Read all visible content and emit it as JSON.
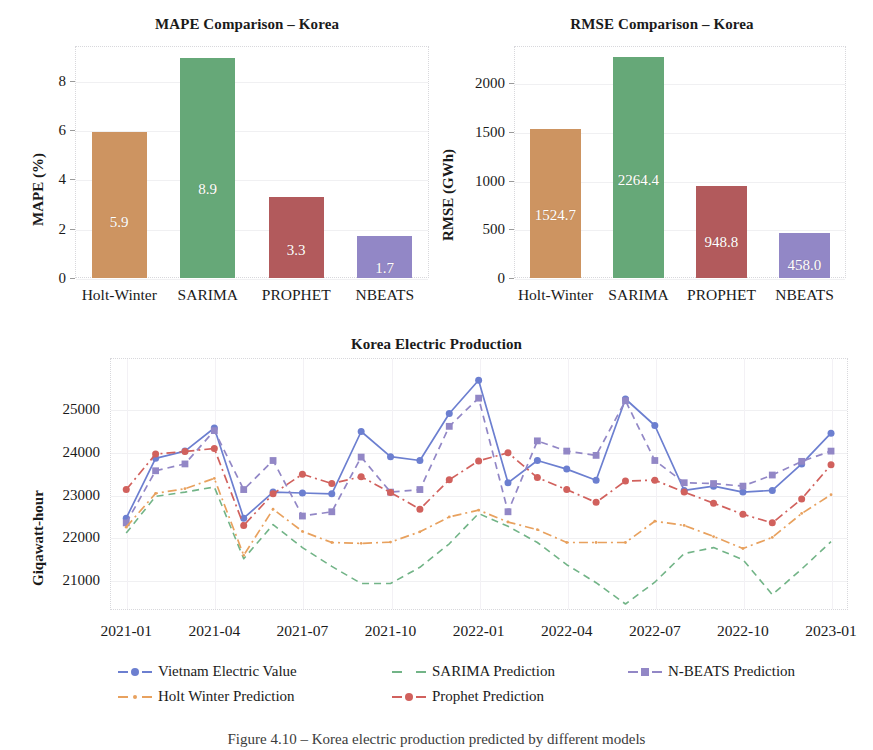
{
  "figure": {
    "caption": "Figure 4.10 – Korea electric production predicted by different models"
  },
  "chart_data": [
    {
      "id": "mape",
      "type": "bar",
      "title": "MAPE Comparison – Korea",
      "xlabel": "",
      "ylabel": "MAPE (%)",
      "categories": [
        "Holt-Winter",
        "SARIMA",
        "PROPHET",
        "NBEATS"
      ],
      "values": [
        5.9,
        8.9,
        3.3,
        1.7
      ],
      "value_labels": [
        "5.9",
        "8.9",
        "3.3",
        "1.7"
      ],
      "colors": [
        "#cd9461",
        "#66a878",
        "#b25a5c",
        "#9287c6"
      ],
      "yticks": [
        0,
        2,
        4,
        6,
        8
      ],
      "ytick_labels": [
        "0",
        "2",
        "4",
        "6",
        "8"
      ],
      "ylim": [
        0,
        9.4
      ],
      "grid": true,
      "legend": "none"
    },
    {
      "id": "rmse",
      "type": "bar",
      "title": "RMSE Comparison – Korea",
      "xlabel": "",
      "ylabel": "RMSE (GWh)",
      "categories": [
        "Holt-Winter",
        "SARIMA",
        "PROPHET",
        "NBEATS"
      ],
      "values": [
        1524.7,
        2264.4,
        948.8,
        458.0
      ],
      "value_labels": [
        "1524.7",
        "2264.4",
        "948.8",
        "458.0"
      ],
      "colors": [
        "#cd9461",
        "#66a878",
        "#b25a5c",
        "#9287c6"
      ],
      "yticks": [
        0,
        500,
        1000,
        1500,
        2000
      ],
      "ytick_labels": [
        "0",
        "500",
        "1000",
        "1500",
        "2000"
      ],
      "ylim": [
        0,
        2380
      ],
      "grid": true,
      "legend": "none"
    },
    {
      "id": "timeseries",
      "type": "line",
      "title": "Korea Electric Production",
      "xlabel": "",
      "ylabel": "Giqawatt-hour",
      "ylim": [
        20300,
        26200
      ],
      "yticks": [
        21000,
        22000,
        23000,
        24000,
        25000
      ],
      "ytick_labels": [
        "21000",
        "22000",
        "23000",
        "24000",
        "25000"
      ],
      "xtick_labels": [
        "2021-01",
        "2021-04",
        "2021-07",
        "2021-10",
        "2022-01",
        "2022-04",
        "2022-07",
        "2022-10",
        "2023-01"
      ],
      "xtick_index": [
        0,
        3,
        6,
        9,
        12,
        15,
        18,
        21,
        24
      ],
      "x": [
        "2021-01",
        "2021-02",
        "2021-03",
        "2021-04",
        "2021-05",
        "2021-06",
        "2021-07",
        "2021-08",
        "2021-09",
        "2021-10",
        "2021-11",
        "2021-12",
        "2022-01",
        "2022-02",
        "2022-03",
        "2022-04",
        "2022-05",
        "2022-06",
        "2022-07",
        "2022-08",
        "2022-09",
        "2022-10",
        "2022-11",
        "2022-12",
        "2023-01"
      ],
      "grid": true,
      "legend": "bottom",
      "series": [
        {
          "name": "Vietnam Electric Value",
          "color": "#6c7fd0",
          "marker": "circle",
          "dash": "solid",
          "values": [
            22450,
            23850,
            24020,
            24560,
            22450,
            23060,
            23040,
            23020,
            24480,
            23890,
            23800,
            24900,
            25680,
            23280,
            23800,
            23600,
            23340,
            25240,
            24620,
            23100,
            23200,
            23060,
            23100,
            23720,
            24440
          ]
        },
        {
          "name": "SARIMA Prediction",
          "color": "#72b487",
          "marker": "none",
          "dash": "dashed",
          "values": [
            22100,
            22960,
            23060,
            23180,
            21500,
            22300,
            21760,
            21320,
            20920,
            20920,
            21300,
            21850,
            22560,
            22260,
            21880,
            21360,
            20940,
            20440,
            20950,
            21620,
            21760,
            21480,
            20660,
            21260,
            21900
          ]
        },
        {
          "name": "N-BEATS Prediction",
          "color": "#9287c6",
          "marker": "square",
          "dash": "dashed",
          "values": [
            22340,
            23560,
            23720,
            24500,
            23120,
            23800,
            22500,
            22600,
            23880,
            23060,
            23120,
            24600,
            25260,
            22600,
            24260,
            24020,
            23920,
            25200,
            23800,
            23280,
            23260,
            23200,
            23460,
            23780,
            24020
          ]
        },
        {
          "name": "Holt Winter Prediction",
          "color": "#e8a15e",
          "marker": "dot",
          "dash": "dashdot",
          "values": [
            22240,
            23030,
            23140,
            23380,
            21580,
            22660,
            22140,
            21880,
            21860,
            21890,
            22130,
            22480,
            22640,
            22360,
            22180,
            21880,
            21880,
            21880,
            22380,
            22280,
            22020,
            21740,
            22000,
            22560,
            23000
          ]
        },
        {
          "name": "Prophet Prediction",
          "color": "#d1615d",
          "marker": "circle",
          "dash": "dashdot",
          "values": [
            23120,
            23950,
            24010,
            24080,
            22280,
            23020,
            23480,
            23260,
            23420,
            23050,
            22660,
            23350,
            23790,
            23980,
            23400,
            23120,
            22820,
            23320,
            23340,
            23060,
            22800,
            22540,
            22340,
            22900,
            23700
          ]
        }
      ]
    }
  ]
}
